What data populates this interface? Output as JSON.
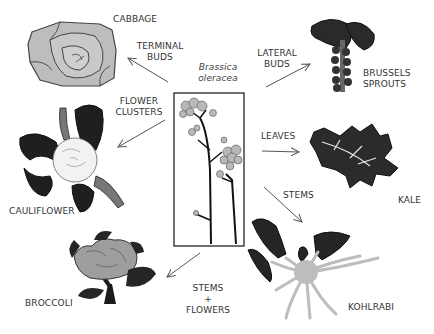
{
  "center": {
    "species_line1": "Brassica",
    "species_line2": "oleracea"
  },
  "arrows": {
    "terminal_buds": {
      "line1": "TERMINAL",
      "line2": "BUDS"
    },
    "flower_clusters": {
      "line1": "FLOWER",
      "line2": "CLUSTERS"
    },
    "lateral_buds": {
      "line1": "LATERAL",
      "line2": "BUDS"
    },
    "leaves": {
      "line1": "LEAVES"
    },
    "stems": {
      "line1": "STEMS"
    },
    "stems_flowers": {
      "line1": "STEMS",
      "line2": "+",
      "line3": "FLOWERS"
    }
  },
  "vegetables": {
    "cabbage": "CABBAGE",
    "cauliflower": "CAULIFLOWER",
    "brussels_line1": "BRUSSELS",
    "brussels_line2": "SPROUTS",
    "kale": "KALE",
    "kohlrabi": "KOHLRABI",
    "broccoli": "BROCCOLI"
  },
  "colors": {
    "ink": "#1a1a1a",
    "gray_fill": "#b5b5b5",
    "light_gray": "#d9d9d9",
    "dark_leaf": "#222222",
    "arrow": "#555555"
  }
}
